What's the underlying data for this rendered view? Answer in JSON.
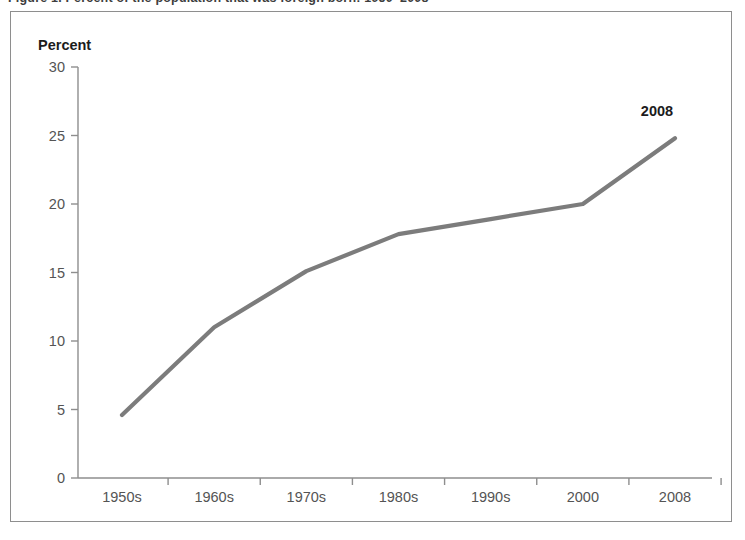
{
  "figure": {
    "title": "Figure 1. Percent of the population that was foreign born: 1950–2008"
  },
  "chart_data": {
    "type": "line",
    "title": "",
    "xlabel": "",
    "ylabel": "Percent",
    "categories": [
      "1950s",
      "1960s",
      "1970s",
      "1980s",
      "1990s",
      "2000",
      "2008"
    ],
    "values": [
      4.6,
      11.0,
      15.1,
      17.8,
      18.9,
      20.0,
      24.8
    ],
    "ylim": [
      0,
      30
    ],
    "yticks": [
      0,
      5,
      10,
      15,
      20,
      25,
      30
    ],
    "ytick_labels": [
      "0",
      "5",
      "10",
      "15",
      "20",
      "25",
      "30"
    ],
    "grid": false,
    "legend": "none",
    "annotations": [
      {
        "label": "2008",
        "x": "2008",
        "y": 24.8
      }
    ],
    "series_color": "#7c7c7c",
    "axis_color": "#8e8e8e",
    "tick_label_color": "#545454"
  }
}
